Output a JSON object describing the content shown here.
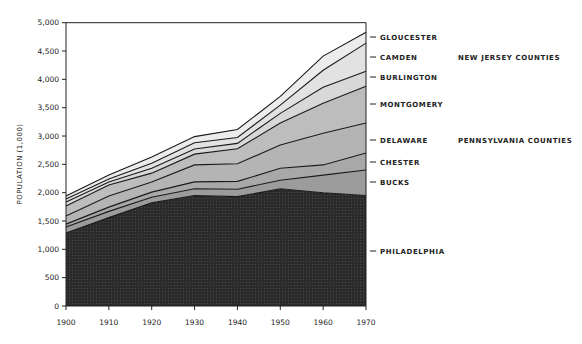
{
  "chart_data": {
    "type": "area",
    "stacked": true,
    "title": "",
    "xlabel": "",
    "ylabel": "POPULATION (1,000)",
    "x": [
      1900,
      1910,
      1920,
      1930,
      1940,
      1950,
      1960,
      1970
    ],
    "xticks": [
      "1900",
      "1910",
      "1920",
      "1930",
      "1940",
      "1950",
      "1960",
      "1970"
    ],
    "yticks": [
      "0",
      "500",
      "1,000",
      "1,500",
      "2,000",
      "2,500",
      "3,000",
      "3,500",
      "4,000",
      "4,500",
      "5,000"
    ],
    "ylim": [
      0,
      5000
    ],
    "grid": false,
    "legend_position": "right (direct labels)",
    "series": [
      {
        "name": "PHILADELPHIA",
        "group": "PENNSYLVANIA COUNTIES",
        "color": "#2b2b2b",
        "values": [
          1290,
          1560,
          1820,
          1950,
          1930,
          2070,
          2000,
          1950
        ]
      },
      {
        "name": "BUCKS",
        "group": "PENNSYLVANIA COUNTIES",
        "color": "#9c9c9c",
        "values": [
          105,
          110,
          100,
          120,
          130,
          150,
          310,
          450
        ]
      },
      {
        "name": "CHESTER",
        "group": "PENNSYLVANIA COUNTIES",
        "color": "#a8a8a8",
        "values": [
          50,
          75,
          90,
          120,
          140,
          210,
          180,
          300
        ]
      },
      {
        "name": "DELAWARE",
        "group": "PENNSYLVANIA COUNTIES",
        "color": "#b4b4b4",
        "values": [
          145,
          195,
          180,
          300,
          310,
          410,
          560,
          530
        ]
      },
      {
        "name": "MONTGOMERY",
        "group": "PENNSYLVANIA COUNTIES",
        "color": "#bdbdbd",
        "values": [
          175,
          195,
          155,
          190,
          265,
          390,
          530,
          650
        ]
      },
      {
        "name": "BURLINGTON",
        "group": "NEW JERSEY COUNTIES",
        "color": "#d8d8d8",
        "values": [
          70,
          55,
          85,
          90,
          95,
          170,
          280,
          265
        ]
      },
      {
        "name": "CAMDEN",
        "group": "NEW JERSEY COUNTIES",
        "color": "#e2e2e2",
        "values": [
          55,
          50,
          90,
          110,
          105,
          145,
          300,
          495
        ]
      },
      {
        "name": "GLOUCESTER",
        "group": "NEW JERSEY COUNTIES",
        "color": "#ececec",
        "values": [
          50,
          70,
          110,
          110,
          140,
          155,
          250,
          190
        ]
      }
    ],
    "totals": [
      1940,
      2310,
      2630,
      2990,
      3115,
      3700,
      4410,
      4830
    ],
    "annotations": [
      "NEW JERSEY COUNTIES",
      "PENNSYLVANIA COUNTIES"
    ]
  },
  "labels": {
    "ylabel": "POPULATION (1,000)",
    "group_nj": "NEW JERSEY COUNTIES",
    "group_pa": "PENNSYLVANIA COUNTIES",
    "series": [
      "PHILADELPHIA",
      "BUCKS",
      "CHESTER",
      "DELAWARE",
      "MONTGOMERY",
      "BURLINGTON",
      "CAMDEN",
      "GLOUCESTER"
    ],
    "xticks": [
      "1900",
      "1910",
      "1920",
      "1930",
      "1940",
      "1950",
      "1960",
      "1970"
    ],
    "yticks": [
      "0",
      "500",
      "1,000",
      "1,500",
      "2,000",
      "2,500",
      "3,000",
      "3,500",
      "4,000",
      "4,500",
      "5,000"
    ]
  }
}
